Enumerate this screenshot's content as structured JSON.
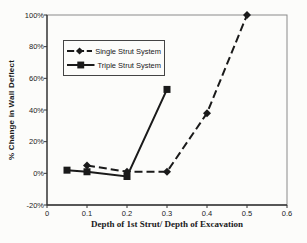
{
  "chart_data": {
    "type": "line",
    "title": "",
    "xlabel": "Depth of 1st Strut/ Depth of Excavation",
    "ylabel": "% Change in Wall Deflect",
    "xlim": [
      0,
      0.6
    ],
    "ylim": [
      -20,
      100
    ],
    "xticks": [
      0,
      0.1,
      0.2,
      0.3,
      0.4,
      0.5,
      0.6
    ],
    "xtick_labels": [
      "0",
      "0.1",
      "0.2",
      "0.3",
      "0.4",
      "0.5",
      "0.6"
    ],
    "yticks": [
      -20,
      0,
      20,
      40,
      60,
      80,
      100
    ],
    "ytick_labels": [
      "-20%",
      "0%",
      "20%",
      "40%",
      "60%",
      "80%",
      "100%"
    ],
    "grid": false,
    "legend_position": "upper-left-inside",
    "axis_color": "#333333",
    "series": [
      {
        "name": "Single Strut System",
        "marker": "diamond",
        "line_style": "dashed",
        "color": "#1a1a1a",
        "points": [
          [
            0.1,
            5
          ],
          [
            0.2,
            1
          ],
          [
            0.3,
            1
          ],
          [
            0.4,
            38
          ],
          [
            0.5,
            100
          ]
        ]
      },
      {
        "name": "Triple Strut System",
        "marker": "square",
        "line_style": "solid",
        "color": "#1a1a1a",
        "points": [
          [
            0.05,
            2
          ],
          [
            0.1,
            1
          ],
          [
            0.2,
            -2
          ],
          [
            0.3,
            53
          ]
        ]
      }
    ]
  }
}
